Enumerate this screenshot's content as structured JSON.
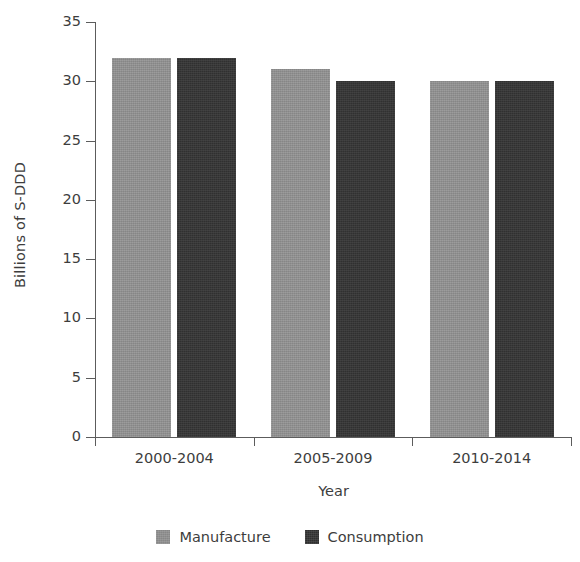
{
  "chart_data": {
    "type": "bar",
    "title": "",
    "subtitle": "",
    "xlabel": "Year",
    "ylabel": "Billions of S-DDD",
    "categories": [
      "2000-2004",
      "2005-2009",
      "2010-2014"
    ],
    "series": [
      {
        "name": "Manufacture",
        "color": "#8f8f8f",
        "values": [
          32,
          31,
          30
        ]
      },
      {
        "name": "Consumption",
        "color": "#333333",
        "values": [
          32,
          30,
          30
        ]
      }
    ],
    "ylim": [
      0,
      35
    ],
    "ytick_labels": [
      "0",
      "5",
      "10",
      "15",
      "20",
      "25",
      "30",
      "35"
    ],
    "ytick_values": [
      0,
      5,
      10,
      15,
      20,
      25,
      30,
      35
    ],
    "grid": false,
    "legend_position": "bottom-center",
    "background_color": "#ffffff",
    "axis_color": "#5c5c5c",
    "text_color": "#3d3d3d"
  }
}
